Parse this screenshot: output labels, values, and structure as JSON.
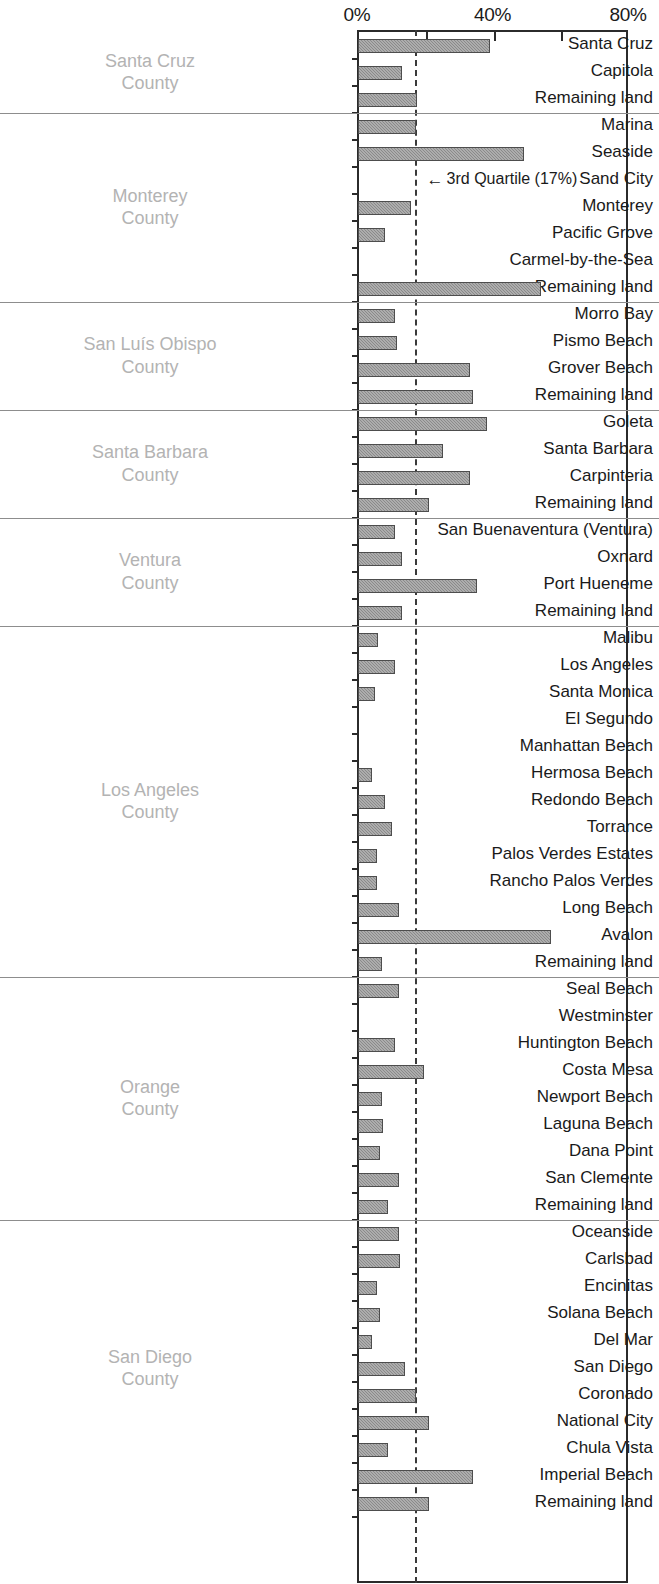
{
  "chart_data": {
    "type": "bar",
    "orientation": "horizontal",
    "title": "",
    "xlabel": "",
    "ylabel": "",
    "xlim": [
      0,
      80
    ],
    "xtick_labels": [
      "0%",
      "40%",
      "80%"
    ],
    "xtick_values": [
      0,
      40,
      80
    ],
    "minor_tick_values": [
      20,
      60
    ],
    "grid": false,
    "legend": null,
    "annotations": [
      {
        "text": "3rd Quartile (17%)",
        "arrow": "←",
        "value": 17,
        "style": "dashed-vertical-line"
      }
    ],
    "reference_line": {
      "label": "3rd Quartile",
      "value": 17,
      "value_label": "17%"
    },
    "bar_color": "#8a8a8a",
    "bar_border_color": "#4d4d4d",
    "group_label_color": "#b3b3b3",
    "axis_color": "#2b2b2b",
    "groups": [
      {
        "name": "Santa Cruz\nCounty",
        "categories": [
          "Santa Cruz",
          "Capitola",
          "Remaining land"
        ],
        "values": [
          39,
          13,
          17.5
        ]
      },
      {
        "name": "Monterey\nCounty",
        "categories": [
          "Marina",
          "Seaside",
          "Sand City",
          "Monterey",
          "Pacific Grove",
          "Carmel-by-the-Sea",
          "Remaining land"
        ],
        "values": [
          17,
          49,
          0,
          15.5,
          8,
          0,
          54
        ]
      },
      {
        "name": "San Luís Obispo\nCounty",
        "categories": [
          "Morro Bay",
          "Pismo Beach",
          "Grover Beach",
          "Remaining land"
        ],
        "values": [
          11,
          11.5,
          33,
          34
        ]
      },
      {
        "name": "Santa Barbara\nCounty",
        "categories": [
          "Goleta",
          "Santa Barbara",
          "Carpinteria",
          "Remaining land"
        ],
        "values": [
          38,
          25,
          33,
          21
        ]
      },
      {
        "name": "Ventura\nCounty",
        "categories": [
          "San Buenaventura (Ventura)",
          "Oxnard",
          "Port Hueneme",
          "Remaining land"
        ],
        "values": [
          11,
          13,
          35,
          13
        ]
      },
      {
        "name": "Los Angeles\nCounty",
        "categories": [
          "Malibu",
          "Los Angeles",
          "Santa Monica",
          "El Segundo",
          "Manhattan Beach",
          "Hermosa Beach",
          "Redondo Beach",
          "Torrance",
          "Palos Verdes Estates",
          "Rancho Palos Verdes",
          "Long Beach",
          "Avalon",
          "Remaining land"
        ],
        "values": [
          6,
          11,
          5,
          0,
          0,
          4,
          8,
          10,
          5.5,
          5.5,
          12,
          57,
          7
        ]
      },
      {
        "name": "Orange\nCounty",
        "categories": [
          "Seal Beach",
          "Westminster",
          "Huntington Beach",
          "Costa Mesa",
          "Newport Beach",
          "Laguna Beach",
          "Dana Point",
          "San Clemente",
          "Remaining land"
        ],
        "values": [
          12,
          0,
          11,
          19.5,
          7,
          7.5,
          6.5,
          12,
          9
        ]
      },
      {
        "name": "San Diego\nCounty",
        "categories": [
          "Oceanside",
          "Carlsbad",
          "Encinitas",
          "Solana Beach",
          "Del Mar",
          "San Diego",
          "Coronado",
          "National City",
          "Chula Vista",
          "Imperial Beach",
          "Remaining land"
        ],
        "values": [
          12,
          12.5,
          5.5,
          6.5,
          4,
          14,
          17,
          21,
          9,
          34,
          21
        ]
      }
    ]
  }
}
